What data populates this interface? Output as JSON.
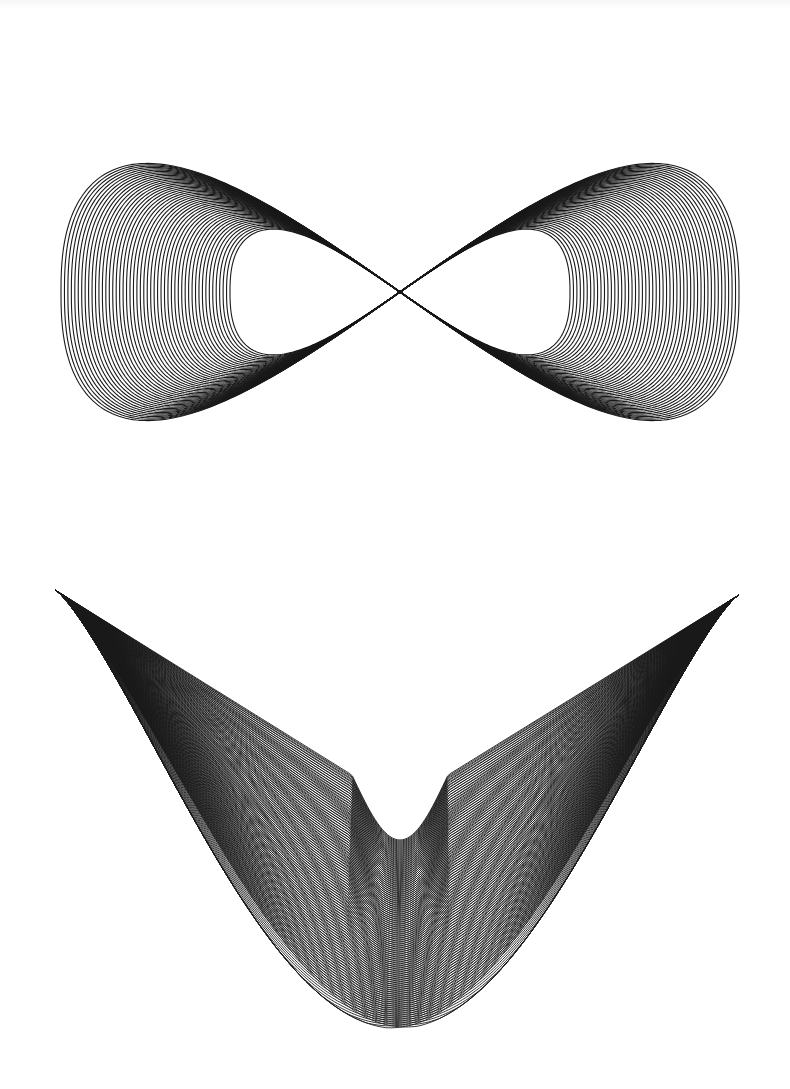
{
  "page": {
    "background": "#ffffff",
    "ink_color": "#1a1a1a"
  },
  "figures": [
    {
      "id": "figure-eight",
      "label": "Nested figure-eight (lemniscate) curve family",
      "center": [
        400,
        292
      ],
      "outer_half_width": 339,
      "outer_half_height": 221,
      "inner_half_width": 170,
      "inner_half_height": 108,
      "curve_count": 50,
      "stroke_width": 1.1
    },
    {
      "id": "moire-bowl",
      "label": "V-shaped bowl of curve families forming moire rings",
      "left_tip": [
        55,
        590
      ],
      "right_tip": [
        739,
        595
      ],
      "notch_shoulder_left": [
        352,
        775
      ],
      "notch_shoulder_right": [
        448,
        775
      ],
      "notch_bottom": [
        400,
        840
      ],
      "bowl_bottom": [
        400,
        1026
      ],
      "curve_count": 95,
      "stroke_width": 0.9
    }
  ]
}
